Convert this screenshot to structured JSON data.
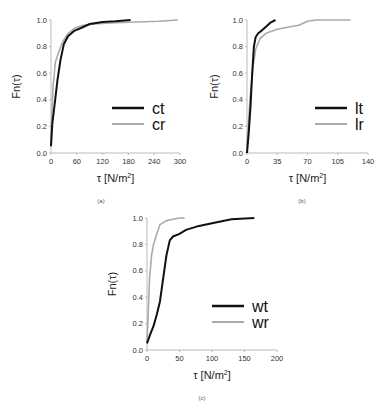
{
  "chart_data": [
    {
      "type": "line",
      "caption": "(a)",
      "xlabel": "τ [N/m²]",
      "ylabel": "Fn(τ)",
      "xlim": [
        0,
        300
      ],
      "ylim": [
        0,
        1.0
      ],
      "xticks": [
        "0",
        "60",
        "120",
        "180",
        "240",
        "300"
      ],
      "yticks": [
        "0.0",
        "0.2",
        "0.4",
        "0.6",
        "0.8",
        "1.0"
      ],
      "legend_position": "lower right",
      "series": [
        {
          "name": "ct",
          "color": "#111111",
          "x": [
            0,
            3,
            8,
            15,
            22,
            30,
            40,
            55,
            70,
            90,
            120,
            150,
            185
          ],
          "y": [
            0.05,
            0.22,
            0.35,
            0.55,
            0.7,
            0.82,
            0.88,
            0.92,
            0.94,
            0.97,
            0.985,
            0.99,
            1.0
          ]
        },
        {
          "name": "cr",
          "color": "#aaaaaa",
          "x": [
            0,
            2,
            5,
            10,
            18,
            28,
            40,
            55,
            75,
            100,
            150,
            200,
            250,
            295
          ],
          "y": [
            0.1,
            0.3,
            0.5,
            0.68,
            0.76,
            0.84,
            0.9,
            0.94,
            0.96,
            0.97,
            0.98,
            0.985,
            0.99,
            1.0
          ]
        }
      ]
    },
    {
      "type": "line",
      "caption": "(b)",
      "xlabel": "τ [N/m²]",
      "ylabel": "Fn(τ)",
      "xlim": [
        0,
        140
      ],
      "ylim": [
        0,
        1.0
      ],
      "xticks": [
        "0",
        "35",
        "70",
        "105",
        "140"
      ],
      "yticks": [
        "0.0",
        "0.2",
        "0.4",
        "0.6",
        "0.8",
        "1.0"
      ],
      "legend_position": "lower right",
      "series": [
        {
          "name": "lt",
          "color": "#111111",
          "x": [
            0,
            2,
            4,
            6,
            8,
            10,
            13,
            17,
            22,
            27,
            30,
            33
          ],
          "y": [
            0.0,
            0.15,
            0.35,
            0.6,
            0.8,
            0.87,
            0.9,
            0.92,
            0.95,
            0.98,
            0.99,
            1.0
          ]
        },
        {
          "name": "lr",
          "color": "#aaaaaa",
          "x": [
            0,
            2,
            4,
            7,
            10,
            15,
            22,
            35,
            50,
            60,
            70,
            80,
            100,
            120
          ],
          "y": [
            0.05,
            0.25,
            0.45,
            0.65,
            0.78,
            0.86,
            0.9,
            0.93,
            0.95,
            0.96,
            0.99,
            1.0,
            1.0,
            1.0
          ]
        }
      ]
    },
    {
      "type": "line",
      "caption": "(c)",
      "xlabel": "τ [N/m²]",
      "ylabel": "Fn(τ)",
      "xlim": [
        0,
        200
      ],
      "ylim": [
        0,
        1.0
      ],
      "xticks": [
        "0",
        "50",
        "100",
        "150",
        "200"
      ],
      "yticks": [
        "0.0",
        "0.2",
        "0.4",
        "0.6",
        "0.8",
        "1.0"
      ],
      "legend_position": "lower right",
      "series": [
        {
          "name": "wt",
          "color": "#111111",
          "x": [
            0,
            5,
            10,
            15,
            20,
            25,
            30,
            35,
            40,
            50,
            60,
            80,
            100,
            130,
            165
          ],
          "y": [
            0.05,
            0.12,
            0.18,
            0.27,
            0.37,
            0.55,
            0.72,
            0.83,
            0.86,
            0.88,
            0.91,
            0.94,
            0.96,
            0.99,
            1.0
          ]
        },
        {
          "name": "wr",
          "color": "#aaaaaa",
          "x": [
            0,
            2,
            4,
            7,
            10,
            15,
            20,
            30,
            40,
            50,
            58
          ],
          "y": [
            0.05,
            0.3,
            0.55,
            0.72,
            0.8,
            0.88,
            0.95,
            0.98,
            0.99,
            1.0,
            1.0
          ]
        }
      ]
    }
  ]
}
